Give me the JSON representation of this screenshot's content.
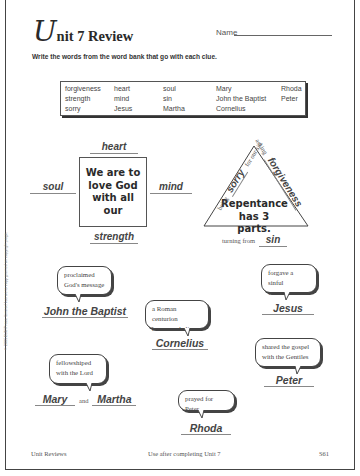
{
  "header": {
    "title_initial": "U",
    "title_rest": "nit 7 Review",
    "name_label": "Name"
  },
  "instructions": "Write the words from the word bank that go with each clue.",
  "word_bank": [
    {
      "word": "forgiveness",
      "x": 4,
      "y": 3
    },
    {
      "word": "heart",
      "x": 53,
      "y": 3
    },
    {
      "word": "soul",
      "x": 102,
      "y": 3
    },
    {
      "word": "Mary",
      "x": 155,
      "y": 3
    },
    {
      "word": "Rhoda",
      "x": 220,
      "y": 3
    },
    {
      "word": "strength",
      "x": 4,
      "y": 13
    },
    {
      "word": "mind",
      "x": 53,
      "y": 13
    },
    {
      "word": "sin",
      "x": 102,
      "y": 13
    },
    {
      "word": "John the Baptist",
      "x": 155,
      "y": 13
    },
    {
      "word": "Peter",
      "x": 220,
      "y": 13
    },
    {
      "word": "sorry",
      "x": 4,
      "y": 23
    },
    {
      "word": "Jesus",
      "x": 53,
      "y": 23
    },
    {
      "word": "Martha",
      "x": 102,
      "y": 23
    },
    {
      "word": "Cornelius",
      "x": 155,
      "y": 23
    }
  ],
  "love_god": {
    "box_text": "We are to love God with all our",
    "answers": {
      "top": "heart",
      "left": "soul",
      "right": "mind",
      "bottom": "strength"
    }
  },
  "repentance": {
    "center_text_1": "Repentance",
    "center_text_2": "has 3 parts.",
    "left_side_prefix": "being",
    "left_side_answer": "sorry",
    "left_side_suffix": "for our sin",
    "right_side_prefix": "asking",
    "right_side_answer": "forgiveness",
    "bottom_prefix": "turning from",
    "bottom_answer": "sin"
  },
  "clues": [
    {
      "id": "john",
      "clue_line1": "proclaimed",
      "clue_line2": "God's message",
      "answer": "John the Baptist"
    },
    {
      "id": "jesus",
      "clue_line1": "forgave a sinful",
      "clue_line2": "woman",
      "answer": "Jesus"
    },
    {
      "id": "cornelius",
      "clue_line1": "a Roman centurion",
      "clue_line2": "became a believer",
      "answer": "Cornelius"
    },
    {
      "id": "marymartha",
      "clue_line1": "fellowshiped",
      "clue_line2": "with the Lord",
      "answer": "Mary",
      "answer2": "Martha",
      "connector": "and"
    },
    {
      "id": "peter",
      "clue_line1": "shared the gospel",
      "clue_line2": "with the Gentiles",
      "answer": "Peter"
    },
    {
      "id": "rhoda",
      "clue_line1": "prayed for Peter",
      "answer": "Rhoda"
    }
  ],
  "footer": {
    "left": "Unit Reviews",
    "center": "Use after completing Unit 7",
    "right": "S61"
  },
  "side_note": "© 2005 BJU Press. Limited license to copy granted on copyright page."
}
